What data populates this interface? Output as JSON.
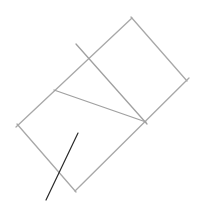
{
  "canvas": {
    "width": 199,
    "height": 207,
    "background": "#ffffff"
  },
  "colors": {
    "light_line": "#a8a8a8",
    "dark_line": "#2a2a2a"
  },
  "rectangle": {
    "corners": {
      "top": [
        132,
        18
      ],
      "right": [
        186,
        80
      ],
      "bottom": [
        74,
        190
      ],
      "left": [
        18,
        125
      ]
    }
  },
  "lines": [
    {
      "name": "rect-top-left-edge",
      "from": [
        132,
        18
      ],
      "to": [
        18,
        125
      ],
      "color": "light"
    },
    {
      "name": "rect-top-right-edge",
      "from": [
        132,
        18
      ],
      "to": [
        186,
        80
      ],
      "color": "light"
    },
    {
      "name": "rect-bottom-right-edge",
      "from": [
        186,
        80
      ],
      "to": [
        74,
        190
      ],
      "color": "light"
    },
    {
      "name": "rect-bottom-left-edge",
      "from": [
        18,
        125
      ],
      "to": [
        74,
        190
      ],
      "color": "light"
    },
    {
      "name": "diagonal-line-1",
      "from": [
        76,
        44
      ],
      "to": [
        146,
        122
      ],
      "color": "light"
    },
    {
      "name": "diagonal-line-2",
      "from": [
        55,
        90
      ],
      "to": [
        146,
        122
      ],
      "color": "light"
    },
    {
      "name": "dark-stroke",
      "from": [
        78,
        133
      ],
      "to": [
        46,
        200
      ],
      "color": "dark"
    }
  ]
}
